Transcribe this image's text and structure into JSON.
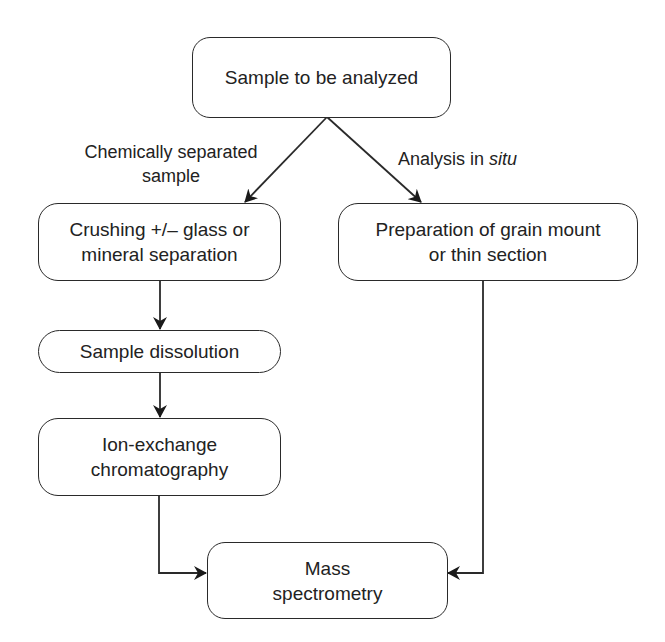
{
  "diagram": {
    "type": "flowchart",
    "nodes": {
      "start": {
        "lines": [
          "Sample to be analyzed"
        ]
      },
      "crushing": {
        "lines": [
          "Crushing +/– glass or",
          "mineral separation"
        ]
      },
      "preparation": {
        "lines": [
          "Preparation of grain mount",
          "or thin section"
        ]
      },
      "dissolution": {
        "lines": [
          "Sample dissolution"
        ]
      },
      "ion_exchange": {
        "lines": [
          "Ion-exchange",
          "chromatography"
        ]
      },
      "mass_spec": {
        "lines": [
          "Mass",
          "spectrometry"
        ]
      }
    },
    "edge_labels": {
      "chemical": {
        "lines": [
          "Chemically separated",
          "sample"
        ]
      },
      "in_situ": {
        "prefix": "Analysis in ",
        "italic": "situ"
      }
    },
    "edges": [
      {
        "from": "start",
        "to": "crushing",
        "label": "Chemically separated sample"
      },
      {
        "from": "start",
        "to": "preparation",
        "label": "Analysis in situ"
      },
      {
        "from": "crushing",
        "to": "dissolution"
      },
      {
        "from": "dissolution",
        "to": "ion_exchange"
      },
      {
        "from": "ion_exchange",
        "to": "mass_spec"
      },
      {
        "from": "preparation",
        "to": "mass_spec"
      }
    ],
    "colors": {
      "stroke": "#2a2a2a",
      "text": "#222222",
      "background": "#ffffff"
    }
  }
}
